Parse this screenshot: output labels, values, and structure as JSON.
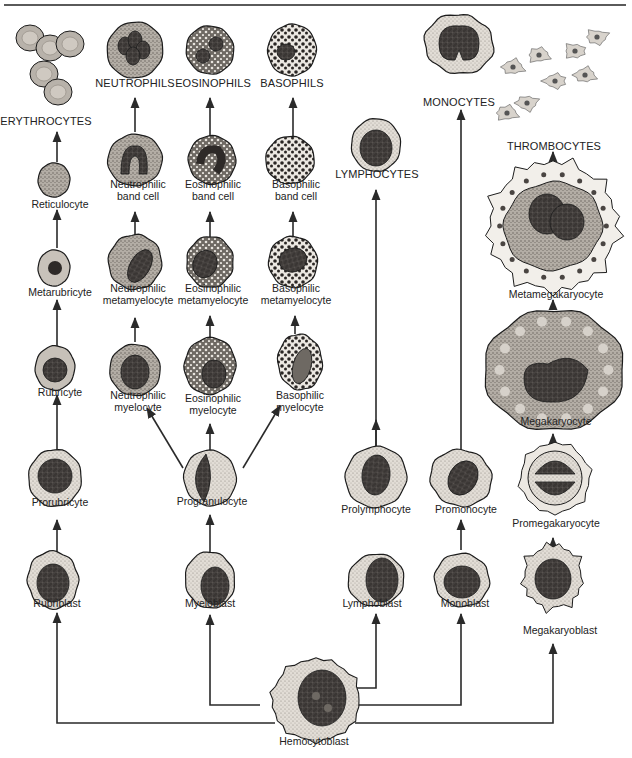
{
  "colors": {
    "ink": "#1c1c1c",
    "cytoplasm_light": "#ece8e2",
    "cytoplasm_gray": "#bdb8b0",
    "cytoplasm_dark": "#8f8a84",
    "nucleus": "#3a3634",
    "nucleus_light": "#5e5955",
    "arrow": "#2a2a2a",
    "rule": "#5a5a5a"
  },
  "stem_cell": {
    "id": "hemocytoblast",
    "label": "Hemocytoblast"
  },
  "lineages": [
    {
      "id": "erythroid",
      "stages": [
        {
          "id": "rubriblast",
          "label": "Rubriblast"
        },
        {
          "id": "prorubricyte",
          "label": "Prorubricyte"
        },
        {
          "id": "rubricyte",
          "label": "Rubricyte"
        },
        {
          "id": "metarubricyte",
          "label": "Metarubricyte"
        },
        {
          "id": "reticulocyte",
          "label": "Reticulocyte"
        },
        {
          "id": "erythrocytes",
          "label": "ERYTHROCYTES",
          "mature": true
        }
      ]
    },
    {
      "id": "granulocytic",
      "stages": [
        {
          "id": "myeloblast",
          "label": "Myeloblast"
        },
        {
          "id": "progranulocyte",
          "label": "Progranulocyte"
        }
      ],
      "branches": [
        {
          "id": "neutrophilic",
          "stages": [
            {
              "id": "neutrophilic-myelocyte",
              "label": "Neutrophilic\nmyelocyte"
            },
            {
              "id": "neutrophilic-metamyelocyte",
              "label": "Neutrophilic\nmetamyelocyte"
            },
            {
              "id": "neutrophilic-band-cell",
              "label": "Neutrophilic\nband cell"
            },
            {
              "id": "neutrophils",
              "label": "NEUTROPHILS",
              "mature": true
            }
          ]
        },
        {
          "id": "eosinophilic",
          "stages": [
            {
              "id": "eosinophilic-myelocyte",
              "label": "Eosinophilic\nmyelocyte"
            },
            {
              "id": "eosinophilic-metamyelocyte",
              "label": "Eosinophilic\nmetamyelocyte"
            },
            {
              "id": "eosinophilic-band-cell",
              "label": "Eosinophilic\nband cell"
            },
            {
              "id": "eosinophils",
              "label": "EOSINOPHILS",
              "mature": true
            }
          ]
        },
        {
          "id": "basophilic",
          "stages": [
            {
              "id": "basophilic-myelocyte",
              "label": "Basophilic\nmyelocyte"
            },
            {
              "id": "basophilic-metamyelocyte",
              "label": "Basophilic\nmetamyelocyte"
            },
            {
              "id": "basophilic-band-cell",
              "label": "Basophilic\nband cell"
            },
            {
              "id": "basophils",
              "label": "BASOPHILS",
              "mature": true
            }
          ]
        }
      ]
    },
    {
      "id": "lymphoid",
      "stages": [
        {
          "id": "lymphoblast",
          "label": "Lymphoblast"
        },
        {
          "id": "prolymphocyte",
          "label": "Prolymphocyte"
        },
        {
          "id": "lymphocytes",
          "label": "LYMPHOCYTES",
          "mature": true
        }
      ]
    },
    {
      "id": "monocytic",
      "stages": [
        {
          "id": "monoblast",
          "label": "Monoblast"
        },
        {
          "id": "promonocyte",
          "label": "Promonocyte"
        },
        {
          "id": "monocytes",
          "label": "MONOCYTES",
          "mature": true
        }
      ]
    },
    {
      "id": "megakaryocytic",
      "stages": [
        {
          "id": "megakaryoblast",
          "label": "Megakaryoblast"
        },
        {
          "id": "promegakaryocyte",
          "label": "Promegakaryocyte"
        },
        {
          "id": "megakaryocyte",
          "label": "Megakaryocyte"
        },
        {
          "id": "metamegakaryocyte",
          "label": "Metamegakaryocyte"
        },
        {
          "id": "thrombocytes",
          "label": "THROMBOCYTES",
          "mature": true
        }
      ]
    }
  ]
}
